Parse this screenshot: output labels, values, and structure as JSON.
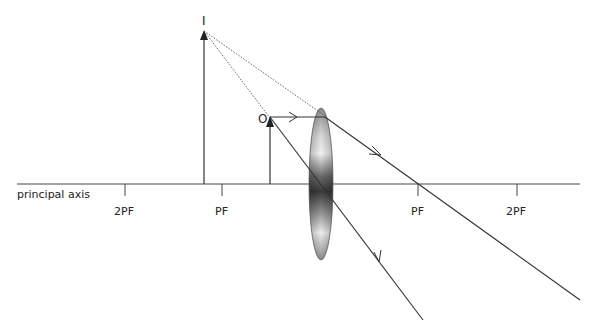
{
  "diagram": {
    "axis_label": "principal axis",
    "tick_labels": {
      "left_2pf": "2PF",
      "left_pf": "PF",
      "right_pf": "PF",
      "right_2pf": "2PF"
    },
    "object_label": "O",
    "image_label": "I",
    "colors": {
      "line": "#333333",
      "dotted": "#555555",
      "lens_dark": "#3a3a3a",
      "lens_light": "#f0f0f0"
    }
  }
}
